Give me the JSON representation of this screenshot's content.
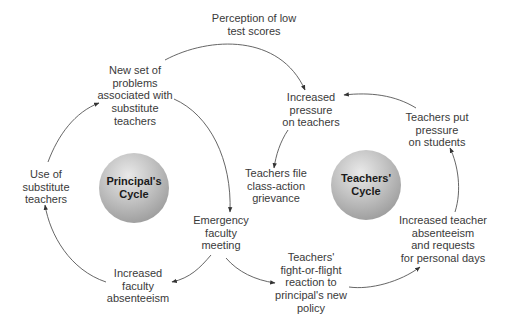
{
  "cycles": {
    "principal": {
      "label_line1": "Principal's",
      "label_line2": "Cycle"
    },
    "teachers": {
      "label_line1": "Teachers'",
      "label_line2": "Cycle"
    }
  },
  "nodes": {
    "perception_low_scores": [
      "Perception of low",
      "test scores"
    ],
    "new_problems": [
      "New set of",
      "problems",
      "associated with",
      "substitute",
      "teachers"
    ],
    "increased_pressure": [
      "Increased",
      "pressure",
      "on teachers"
    ],
    "teachers_put_pressure": [
      "Teachers put",
      "pressure",
      "on students"
    ],
    "use_of_substitutes": [
      "Use of",
      "substitute",
      "teachers"
    ],
    "class_action": [
      "Teachers file",
      "class-action",
      "grievance"
    ],
    "emergency_meeting": [
      "Emergency",
      "faculty",
      "meeting"
    ],
    "teacher_absenteeism": [
      "Increased teacher",
      "absenteeism",
      "and requests",
      "for personal days"
    ],
    "faculty_absenteeism": [
      "Increased",
      "faculty",
      "absenteeism"
    ],
    "fight_or_flight": [
      "Teachers'",
      "fight-or-flight",
      "reaction to",
      "principal's new",
      "policy"
    ]
  },
  "colors": {
    "text": "#3a3a3a",
    "arrow": "#4a4a4a",
    "sphere_light": "#e9e9e9",
    "sphere_dark": "#8d8d8d"
  }
}
